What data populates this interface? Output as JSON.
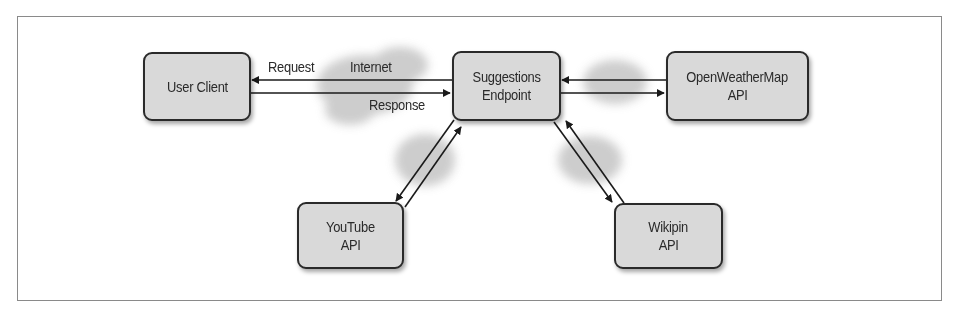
{
  "diagram": {
    "nodes": {
      "user_client": {
        "lines": [
          "User Client"
        ]
      },
      "suggestions_endpoint": {
        "lines": [
          "Suggestions",
          "Endpoint"
        ]
      },
      "openweathermap_api": {
        "lines": [
          "OpenWeatherMap",
          "API"
        ]
      },
      "youtube_api": {
        "lines": [
          "YouTube",
          "API"
        ]
      },
      "wikipin_api": {
        "lines": [
          "Wikipin",
          "API"
        ]
      }
    },
    "edge_labels": {
      "request": "Request",
      "internet": "Internet",
      "response": "Response"
    },
    "edges": [
      {
        "from": "suggestions_endpoint",
        "to": "user_client",
        "label": "Request"
      },
      {
        "from": "user_client",
        "to": "suggestions_endpoint",
        "label": "Response"
      },
      {
        "from": "openweathermap_api",
        "to": "suggestions_endpoint"
      },
      {
        "from": "suggestions_endpoint",
        "to": "openweathermap_api"
      },
      {
        "from": "suggestions_endpoint",
        "to": "youtube_api"
      },
      {
        "from": "youtube_api",
        "to": "suggestions_endpoint"
      },
      {
        "from": "wikipin_api",
        "to": "suggestions_endpoint"
      },
      {
        "from": "suggestions_endpoint",
        "to": "wikipin_api"
      }
    ],
    "colors": {
      "node_fill": "#d9d9d9",
      "node_border": "#2a2a2a",
      "cloud": "#c8c8c8",
      "frame_border": "#8a8a8a"
    }
  }
}
